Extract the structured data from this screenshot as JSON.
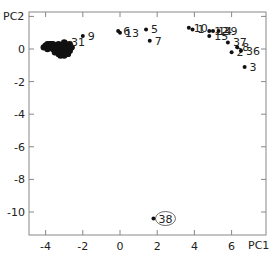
{
  "chart_data": {
    "type": "scatter",
    "title": "",
    "xlabel": "PC1",
    "ylabel": "PC2",
    "xlim": [
      -4.9,
      7.8
    ],
    "ylim": [
      -11.8,
      2.3
    ],
    "grid": false,
    "legend": null,
    "x_ticks": [
      -4,
      -2,
      0,
      2,
      4,
      6
    ],
    "y_ticks": [
      2,
      0,
      -2,
      -4,
      -6,
      -8,
      -10
    ],
    "y_tick_labels_shown": [
      "0",
      "-2",
      "-4",
      "-6",
      "-8",
      "-10"
    ],
    "labeled_points": [
      {
        "label": "9",
        "x": -2.0,
        "y": 0.8
      },
      {
        "label": "31",
        "x": -2.9,
        "y": 0.4
      },
      {
        "label": "6",
        "x": -0.1,
        "y": 1.1
      },
      {
        "label": "13",
        "x": 0.0,
        "y": 1.0
      },
      {
        "label": "5",
        "x": 1.4,
        "y": 1.2
      },
      {
        "label": "7",
        "x": 1.6,
        "y": 0.5
      },
      {
        "label": "10",
        "x": 3.7,
        "y": 1.3
      },
      {
        "label": "1",
        "x": 3.9,
        "y": 1.2
      },
      {
        "label": "12",
        "x": 4.8,
        "y": 1.1
      },
      {
        "label": "14",
        "x": 5.0,
        "y": 1.1
      },
      {
        "label": "39",
        "x": 5.3,
        "y": 1.1
      },
      {
        "label": "15",
        "x": 4.8,
        "y": 0.8
      },
      {
        "label": "37",
        "x": 5.8,
        "y": 0.4
      },
      {
        "label": "2",
        "x": 6.0,
        "y": -0.2
      },
      {
        "label": "8",
        "x": 6.3,
        "y": 0.1
      },
      {
        "label": "36",
        "x": 6.5,
        "y": -0.1
      },
      {
        "label": "3",
        "x": 6.7,
        "y": -1.1
      },
      {
        "label": "38",
        "x": 1.8,
        "y": -10.4,
        "circled": true
      }
    ],
    "cluster": {
      "description": "dense cluster of unlabeled points",
      "x_range": [
        -4.1,
        -2.5
      ],
      "y_range": [
        -0.5,
        0.5
      ],
      "points": [
        [
          -4.0,
          0.2
        ],
        [
          -3.9,
          0.3
        ],
        [
          -3.8,
          0.1
        ],
        [
          -3.7,
          0.3
        ],
        [
          -3.6,
          0.0
        ],
        [
          -3.5,
          0.2
        ],
        [
          -3.4,
          -0.1
        ],
        [
          -3.3,
          0.3
        ],
        [
          -3.2,
          0.1
        ],
        [
          -3.1,
          -0.2
        ],
        [
          -3.0,
          0.4
        ],
        [
          -3.0,
          0.0
        ],
        [
          -2.9,
          -0.3
        ],
        [
          -2.8,
          0.2
        ],
        [
          -2.7,
          -0.1
        ],
        [
          -2.6,
          0.1
        ],
        [
          -3.3,
          -0.3
        ],
        [
          -3.5,
          -0.2
        ],
        [
          -3.1,
          0.2
        ],
        [
          -2.9,
          0.1
        ],
        [
          -3.6,
          0.3
        ],
        [
          -3.2,
          -0.4
        ],
        [
          -2.8,
          -0.3
        ],
        [
          -3.4,
          0.1
        ],
        [
          -3.0,
          -0.4
        ],
        [
          -2.7,
          0.3
        ],
        [
          -3.8,
          0.3
        ],
        [
          -4.1,
          0.1
        ],
        [
          -3.9,
          0.0
        ],
        [
          -3.3,
          0.0
        ]
      ]
    },
    "marker_color": "#111111",
    "axis_color": "#777777"
  }
}
